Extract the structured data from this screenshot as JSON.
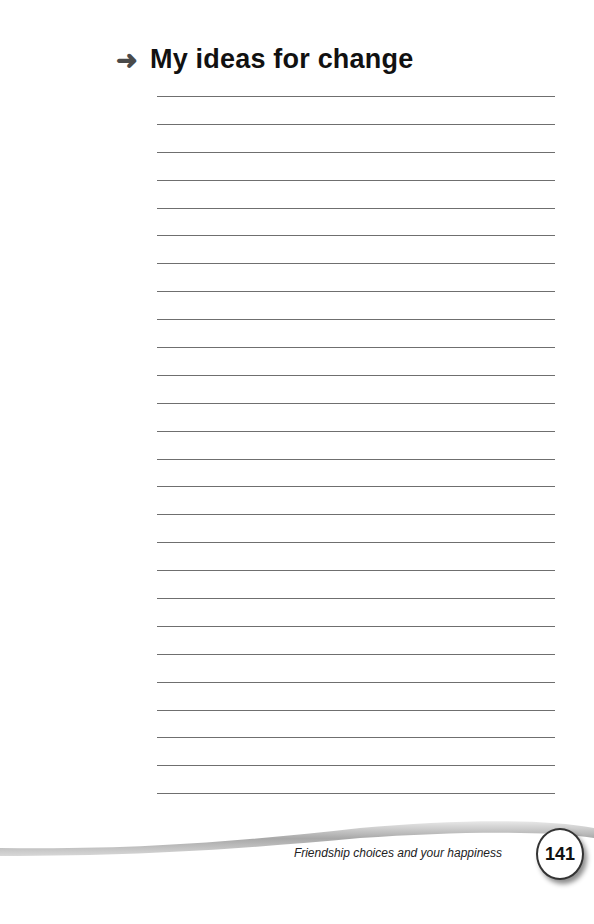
{
  "heading": {
    "icon": "arrow-right-icon",
    "arrow": "➜",
    "title": "My ideas for change"
  },
  "writing_lines": {
    "count": 26
  },
  "footer": {
    "running_title": "Friendship choices and your happiness",
    "page_number": "141"
  }
}
